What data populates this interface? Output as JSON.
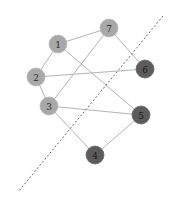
{
  "colors": {
    "side_a_fill": "#a8a8a8",
    "side_b_fill": "#5c5c5c",
    "edge": "#b4b4b4",
    "cut_line": "#5f6c7a"
  },
  "nodes": [
    {
      "id": "1",
      "label": "1",
      "side": "a"
    },
    {
      "id": "2",
      "label": "2",
      "side": "a"
    },
    {
      "id": "3",
      "label": "3",
      "side": "a"
    },
    {
      "id": "4",
      "label": "4",
      "side": "b"
    },
    {
      "id": "5",
      "label": "5",
      "side": "b"
    },
    {
      "id": "6",
      "label": "6",
      "side": "b"
    },
    {
      "id": "7",
      "label": "7",
      "side": "a"
    }
  ],
  "edges": [
    {
      "from": "1",
      "to": "7"
    },
    {
      "from": "1",
      "to": "2"
    },
    {
      "from": "1",
      "to": "5"
    },
    {
      "from": "2",
      "to": "6"
    },
    {
      "from": "2",
      "to": "3"
    },
    {
      "from": "3",
      "to": "7"
    },
    {
      "from": "3",
      "to": "5"
    },
    {
      "from": "3",
      "to": "4"
    },
    {
      "from": "4",
      "to": "5"
    },
    {
      "from": "7",
      "to": "6"
    }
  ],
  "cut": {
    "style": "dashed",
    "label": ""
  }
}
